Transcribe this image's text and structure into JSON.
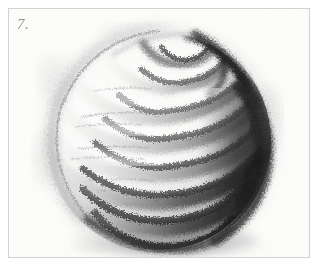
{
  "page": {
    "width": 319,
    "height": 267,
    "background_color": "#ffffff",
    "frame_border_color": "#d2d2d2"
  },
  "plate": {
    "number_label": "7.",
    "number_color": "#8e8e8e"
  },
  "artwork": {
    "title": "Shaded sphere with spiral contour bands",
    "medium": "graphite pencil / charcoal drawing",
    "subject": "sphere",
    "technique": "cross-contour spiral shading",
    "light_direction": "upper-left",
    "shadow_side": "right and lower-right",
    "paper_color": "#fdfdfc",
    "core_shadow_color": "#2b2b2b",
    "mid_tone_color": "#6f6f6f",
    "light_tone_color": "#cfcfcf",
    "highlight_color": "#ffffff",
    "outline_color": "#8a8a8a",
    "sphere": {
      "center_x": 150,
      "center_y": 132,
      "radius": 112
    },
    "spiral_bands": [
      {
        "index": 1,
        "label": "pole-spiral-inner",
        "cy": 46,
        "rx": 30,
        "ry": 12,
        "tone": "dark"
      },
      {
        "index": 2,
        "label": "pole-spiral-second",
        "cy": 52,
        "rx": 52,
        "ry": 20,
        "tone": "dark"
      },
      {
        "index": 3,
        "label": "band-upper",
        "cy": 72,
        "rx": 76,
        "ry": 26,
        "tone": "mid"
      },
      {
        "index": 4,
        "label": "band-upper-mid",
        "cy": 100,
        "rx": 95,
        "ry": 30,
        "tone": "mid"
      },
      {
        "index": 5,
        "label": "band-equator",
        "cy": 132,
        "rx": 105,
        "ry": 32,
        "tone": "mid"
      },
      {
        "index": 6,
        "label": "band-lower-mid",
        "cy": 166,
        "rx": 100,
        "ry": 32,
        "tone": "dark"
      },
      {
        "index": 7,
        "label": "band-lower",
        "cy": 198,
        "rx": 84,
        "ry": 30,
        "tone": "dark"
      },
      {
        "index": 8,
        "label": "band-base",
        "cy": 226,
        "rx": 58,
        "ry": 24,
        "tone": "darkest"
      }
    ],
    "band_count": 8
  }
}
